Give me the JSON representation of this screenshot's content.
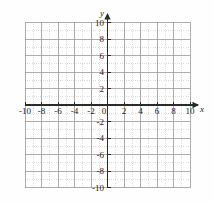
{
  "chart_data": {
    "type": "grid",
    "title": "",
    "xlabel": "x",
    "ylabel": "y",
    "xlim": [
      -10,
      10
    ],
    "ylim": [
      -10,
      10
    ],
    "minor_tick_step": 1,
    "major_tick_step": 2,
    "grid": true,
    "x_tick_labels": [
      "-10",
      "-8",
      "-6",
      "-4",
      "-2",
      "0",
      "2",
      "4",
      "6",
      "8",
      "10"
    ],
    "x_tick_values": [
      -10,
      -8,
      -6,
      -4,
      -2,
      0,
      2,
      4,
      6,
      8,
      10
    ],
    "y_tick_labels": [
      "10",
      "8",
      "6",
      "4",
      "2",
      "-2",
      "-4",
      "-6",
      "-8",
      "-10"
    ],
    "y_tick_values": [
      10,
      8,
      6,
      4,
      2,
      -2,
      -4,
      -6,
      -8,
      -10
    ],
    "origin_label": "0",
    "series": [],
    "annotations": [],
    "legend": null,
    "colors": {
      "background": "#fefefe",
      "minor_gridline": "#cccccc",
      "major_gridline": "#999999",
      "axis": "#2a2a2a",
      "label_text": "#1b1b1b"
    }
  },
  "geometry": {
    "plot_left": 25,
    "plot_top": 22,
    "plot_right": 190,
    "plot_bottom": 188,
    "origin_x": 107.5,
    "origin_y": 105,
    "unit_px": 8.25
  }
}
